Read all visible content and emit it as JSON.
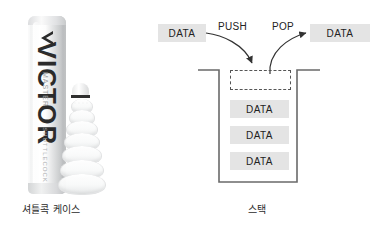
{
  "canvas": {
    "width": 378,
    "height": 237,
    "background": "#ffffff"
  },
  "left": {
    "caption": "셔틀콕 케이스",
    "photo": {
      "alt_name": "shuttlecock-tube-photo",
      "tube_brand": "VICTOR",
      "tube_sub_text": "MASTER",
      "tube_sub_text2": "SHUTTLECOCK",
      "tube_color": "#eceded",
      "shuttle_band_color": "#2e2e2e"
    }
  },
  "right": {
    "caption": "스택",
    "input_chip": {
      "label": "DATA"
    },
    "output_chip": {
      "label": "DATA"
    },
    "push_label": "PUSH",
    "pop_label": "POP",
    "top_slot": {
      "label": "",
      "style": "dashed"
    },
    "stack_items": [
      {
        "label": "DATA"
      },
      {
        "label": "DATA"
      },
      {
        "label": "DATA"
      }
    ],
    "colors": {
      "chip_bg": "#e4e4e4",
      "text": "#222222",
      "stroke": "#555555",
      "container_stroke": "#6a6a6a"
    }
  }
}
